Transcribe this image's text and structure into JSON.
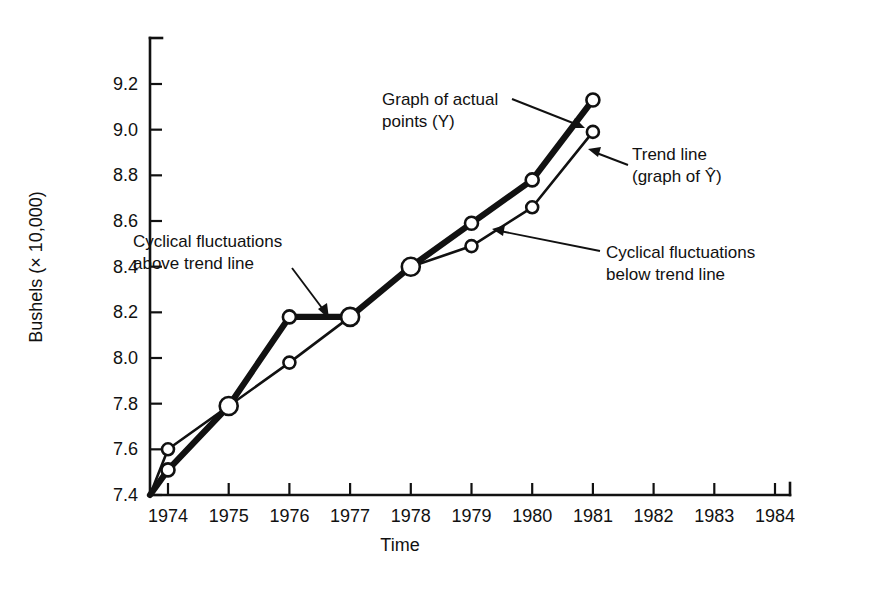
{
  "figure": {
    "background_color": "#ffffff",
    "ink_color": "#111111"
  },
  "chart_data": {
    "type": "line",
    "title": "",
    "subtitle": "",
    "xlabel": "Time",
    "ylabel": "Bushels (× 10,000)",
    "xlim": [
      1973.7,
      1984.3
    ],
    "ylim": [
      7.4,
      9.3
    ],
    "grid": false,
    "legend_position": "none",
    "x": [
      1974,
      1975,
      1976,
      1977,
      1978,
      1979,
      1980,
      1981
    ],
    "categories": [
      "1974",
      "1975",
      "1976",
      "1977",
      "1978",
      "1979",
      "1980",
      "1981"
    ],
    "xtick_labels": [
      "1974",
      "1975",
      "1976",
      "1977",
      "1978",
      "1979",
      "1980",
      "1981",
      "1982",
      "1983",
      "1984"
    ],
    "ytick_labels": [
      "7.4",
      "7.6",
      "7.8",
      "8.0",
      "8.2",
      "8.4",
      "8.6",
      "8.8",
      "9.0",
      "9.2"
    ],
    "ytick_values": [
      7.4,
      7.6,
      7.8,
      8.0,
      8.2,
      8.4,
      8.6,
      8.8,
      9.0,
      9.2
    ],
    "series": [
      {
        "name": "Graph of actual points (Y)",
        "key": "actual",
        "style": "thick",
        "values": [
          7.51,
          7.79,
          8.18,
          8.18,
          8.4,
          8.59,
          8.78,
          9.13
        ]
      },
      {
        "name": "Trend line (graph of Y-hat)",
        "key": "trend",
        "style": "thin",
        "origin_value": 7.4,
        "values": [
          7.6,
          7.79,
          7.98,
          8.18,
          8.4,
          8.49,
          8.66,
          8.99
        ]
      }
    ],
    "annotations": [
      {
        "id": "cyclical-above",
        "line1": "Cyclical fluctuations",
        "line2": "above trend line"
      },
      {
        "id": "graph-of-actual",
        "line1": "Graph of actual",
        "line2": "points (Y)"
      },
      {
        "id": "trend-line",
        "line1": "Trend line",
        "line2": "(graph of Ŷ)"
      },
      {
        "id": "cyclical-below",
        "line1": "Cyclical fluctuations",
        "line2": "below trend line"
      }
    ]
  }
}
